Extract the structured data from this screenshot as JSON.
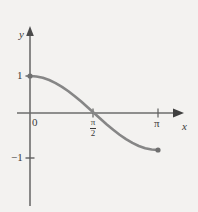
{
  "figure": {
    "background_color": "#f3f2f0",
    "axis_color": "#6d6d6d",
    "curve_color": "#868686",
    "text_color": "#3a3a3a"
  },
  "axes": {
    "x_label": "x",
    "y_label": "y",
    "origin_label": "0"
  },
  "ticks": {
    "y_one": "1",
    "y_negative_one": "−1",
    "x_pi": "π",
    "x_pi_half_numerator": "π",
    "x_pi_half_denominator": "2"
  },
  "chart_data": {
    "type": "line",
    "title": "",
    "subtitle": "",
    "xlabel": "x",
    "ylabel": "y",
    "xlim": [
      0,
      3.14159265
    ],
    "ylim": [
      -1,
      1
    ],
    "grid": false,
    "legend": "none",
    "x_tick_values": [
      0,
      1.57079633,
      3.14159265
    ],
    "x_tick_labels": [
      "0",
      "π/2",
      "π"
    ],
    "y_tick_values": [
      -1,
      1
    ],
    "y_tick_labels": [
      "−1",
      "1"
    ],
    "series": [
      {
        "name": "y = cos x",
        "function": "cos(x)",
        "endpoint_markers": [
          "filled",
          "filled"
        ],
        "x": [
          0.0,
          0.15708,
          0.31416,
          0.47124,
          0.62832,
          0.7854,
          0.94248,
          1.09956,
          1.25664,
          1.41372,
          1.5708,
          1.72788,
          1.88496,
          2.04204,
          2.19911,
          2.35619,
          2.51327,
          2.67035,
          2.82743,
          2.98451,
          3.14159
        ],
        "y": [
          1.0,
          0.98769,
          0.95106,
          0.89101,
          0.80902,
          0.70711,
          0.58779,
          0.45399,
          0.30902,
          0.15643,
          0.0,
          -0.15643,
          -0.30902,
          -0.45399,
          -0.58779,
          -0.70711,
          -0.80902,
          -0.89101,
          -0.95106,
          -0.98769,
          -1.0
        ]
      }
    ],
    "annotations": []
  }
}
